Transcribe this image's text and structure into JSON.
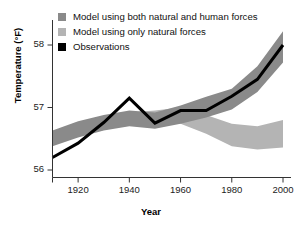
{
  "chart_data": {
    "type": "area",
    "title": "",
    "xlabel": "Year",
    "ylabel": "Temperature (°F)",
    "xlim": [
      1910,
      2000
    ],
    "ylim": [
      55.6,
      58.45
    ],
    "xticks": [
      1920,
      1940,
      1960,
      1980,
      2000
    ],
    "yticks": [
      56,
      57,
      58
    ],
    "grid": false,
    "legend_position": "top-left",
    "x": [
      1910,
      1920,
      1930,
      1940,
      1950,
      1960,
      1970,
      1980,
      1990,
      2000
    ],
    "series": [
      {
        "name": "Model using both natural and human forces",
        "type": "band",
        "color": "#8a8a8a",
        "upper": [
          56.63,
          56.78,
          56.88,
          56.95,
          56.92,
          57.03,
          57.17,
          57.3,
          57.66,
          58.22
        ],
        "lower": [
          56.38,
          56.52,
          56.63,
          56.7,
          56.66,
          56.74,
          56.84,
          56.97,
          57.25,
          57.72
        ]
      },
      {
        "name": "Model using only natural forces",
        "type": "band",
        "color": "#b4b4b4",
        "upper": [
          56.6,
          56.74,
          56.82,
          56.92,
          56.95,
          57.0,
          56.88,
          56.74,
          56.7,
          56.8
        ],
        "lower": [
          56.4,
          56.55,
          56.64,
          56.72,
          56.74,
          56.74,
          56.58,
          56.38,
          56.33,
          56.36
        ]
      },
      {
        "name": "Observations",
        "type": "line",
        "color": "#000000",
        "values": [
          56.2,
          56.43,
          56.76,
          57.15,
          56.75,
          56.95,
          56.95,
          57.18,
          57.45,
          58.0
        ]
      }
    ]
  },
  "legend": {
    "items": [
      {
        "label": "Model using both natural and human forces",
        "color": "#8a8a8a"
      },
      {
        "label": "Model using only natural forces",
        "color": "#b4b4b4"
      },
      {
        "label": "Observations",
        "color": "#000000"
      }
    ]
  },
  "axes": {
    "x_label": "Year",
    "y_label": "Temperature (°F)",
    "x_tick_labels": [
      "1920",
      "1940",
      "1960",
      "1980",
      "2000"
    ],
    "y_tick_labels": [
      "56",
      "57",
      "58"
    ]
  }
}
